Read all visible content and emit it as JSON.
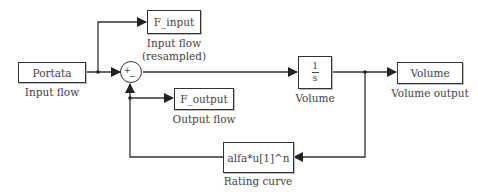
{
  "diagram": {
    "type": "simulink-block-diagram",
    "blocks": {
      "portata": {
        "text": "Portata",
        "caption": "Input flow"
      },
      "f_input": {
        "text": "F_input",
        "caption_line1": "Input flow",
        "caption_line2": "(resampled)"
      },
      "sum": {
        "plus": "+",
        "minus": "−"
      },
      "integrator": {
        "numerator": "1",
        "denominator": "s",
        "caption": "Volume"
      },
      "volume": {
        "text": "Volume",
        "caption": "Volume output"
      },
      "f_output": {
        "text": "F_output",
        "caption": "Output flow"
      },
      "rating": {
        "text": "alfa*u[1]^n",
        "caption": "Rating curve"
      }
    },
    "colors": {
      "line": "#333333",
      "block_border": "#333333",
      "text": "#444444",
      "background": "#ffffff"
    }
  }
}
